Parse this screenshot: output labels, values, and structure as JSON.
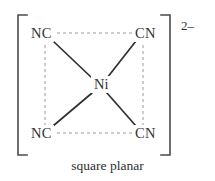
{
  "figure": {
    "caption": "square planar",
    "charge": "2–",
    "metal_center": "Ni",
    "ligands": [
      {
        "position": "top-left",
        "label": "NC"
      },
      {
        "position": "top-right",
        "label": "CN"
      },
      {
        "position": "bottom-left",
        "label": "NC"
      },
      {
        "position": "bottom-right",
        "label": "CN"
      }
    ],
    "colors": {
      "background": "#ffffff",
      "bond": "#303030",
      "guide": "#9a9a9a",
      "bracket": "#4a4a4a",
      "text": "#333333"
    },
    "bracket": {
      "left": "[",
      "right": "]"
    }
  }
}
